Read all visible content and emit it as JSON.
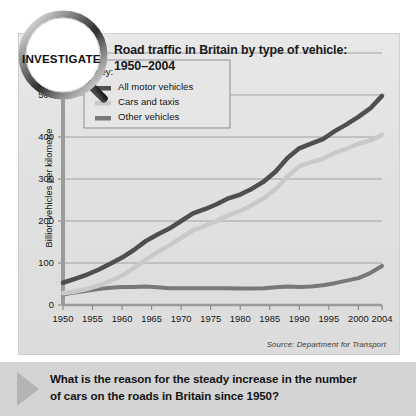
{
  "badge": {
    "label": "INVESTIGATE",
    "icon": "magnifier-icon"
  },
  "header": {
    "title_line1": "Road traffic in Britain by type of vehicle:",
    "title_line2": "1950–2004"
  },
  "legend": {
    "heading": "Key:",
    "items": [
      {
        "label": "All motor vehicles",
        "color": "#4f4f4f"
      },
      {
        "label": "Cars and taxis",
        "color": "#c9c9c9"
      },
      {
        "label": "Other vehicles",
        "color": "#787878"
      }
    ]
  },
  "source": "Source: Department for Transport",
  "question": {
    "line1": "What is the reason for the steady increase in the number",
    "line2": "of cars on the roads in Britain since 1950?",
    "arrow_icon": "triangle-right-icon"
  },
  "colors": {
    "panel_background": "#e3e3e3",
    "question_background": "#d4d4d4",
    "gridline": "#9a9a9a",
    "axis": "#8a8a8a",
    "text": "#141414"
  },
  "chart_data": {
    "type": "line",
    "title": "Road traffic in Britain by type of vehicle: 1950–2004",
    "xlabel": "",
    "ylabel": "Billion vehicles per kilometre",
    "ylim": [
      0,
      600
    ],
    "xlim": [
      1950,
      2004
    ],
    "yticks": [
      0,
      100,
      200,
      300,
      400,
      500,
      600
    ],
    "xticks": [
      1950,
      1955,
      1960,
      1965,
      1970,
      1975,
      1980,
      1985,
      1990,
      1995,
      2000,
      2004
    ],
    "grid": true,
    "legend_position": "top-left-inside",
    "x": [
      1950,
      1952,
      1954,
      1956,
      1958,
      1960,
      1962,
      1964,
      1966,
      1968,
      1970,
      1972,
      1974,
      1976,
      1978,
      1980,
      1982,
      1984,
      1986,
      1988,
      1990,
      1992,
      1994,
      1996,
      1998,
      2000,
      2002,
      2004
    ],
    "series": [
      {
        "name": "All motor vehicles",
        "color": "#4f4f4f",
        "values": [
          53,
          62,
          72,
          84,
          98,
          113,
          131,
          152,
          168,
          182,
          200,
          218,
          228,
          240,
          254,
          263,
          277,
          294,
          318,
          350,
          373,
          384,
          395,
          414,
          430,
          448,
          468,
          498
        ]
      },
      {
        "name": "Cars and taxis",
        "color": "#c9c9c9",
        "values": [
          28,
          32,
          38,
          46,
          57,
          70,
          88,
          108,
          126,
          142,
          160,
          178,
          188,
          200,
          214,
          224,
          238,
          254,
          276,
          306,
          330,
          340,
          348,
          362,
          372,
          384,
          392,
          405
        ]
      },
      {
        "name": "Other vehicles",
        "color": "#787878"
      }
    ]
  }
}
